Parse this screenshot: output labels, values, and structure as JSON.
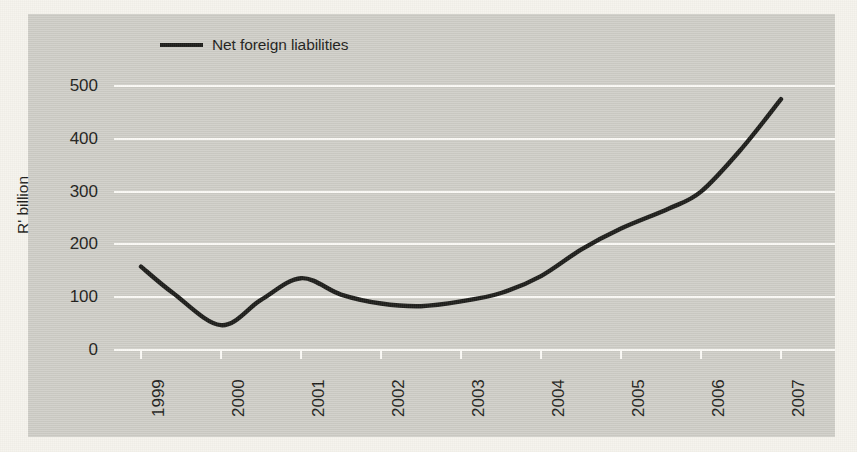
{
  "figure": {
    "background_color": "#f5f3ec",
    "panel_color": "#cfcec7",
    "gridline_color": "#fbfaf6",
    "series_color": "#1b1b18"
  },
  "legend": {
    "position": "top-left-inside",
    "entries": [
      {
        "label": "Net foreign liabilities",
        "color": "#1b1b18",
        "marker": "line-swatch"
      }
    ]
  },
  "axes": {
    "y": {
      "label": "R' billion",
      "ticks": [
        "0",
        "100",
        "200",
        "300",
        "400",
        "500"
      ]
    },
    "x": {
      "label": "",
      "ticks": [
        "1999",
        "2000",
        "2001",
        "2002",
        "2003",
        "2004",
        "2005",
        "2006",
        "2007"
      ]
    }
  },
  "chart_data": {
    "type": "line",
    "title": "",
    "xlabel": "",
    "ylabel": "R' billion",
    "ylim": [
      0,
      520
    ],
    "xlim": [
      1999,
      2007
    ],
    "grid": true,
    "legend_position": "top-left",
    "x": [
      1999,
      2007
    ],
    "categories": [
      "1999",
      "2000",
      "2001",
      "2002",
      "2003",
      "2004",
      "2005",
      "2006",
      "2007"
    ],
    "series": [
      {
        "name": "Net foreign liabilities",
        "color": "#1b1b18",
        "values": [
          158,
          47,
          136,
          88,
          92,
          140,
          230,
          268,
          475
        ],
        "points": [
          {
            "x": 1999.0,
            "y": 158
          },
          {
            "x": 1999.4,
            "y": 108
          },
          {
            "x": 2000.0,
            "y": 47
          },
          {
            "x": 2000.5,
            "y": 95
          },
          {
            "x": 2001.0,
            "y": 136
          },
          {
            "x": 2001.5,
            "y": 105
          },
          {
            "x": 2002.0,
            "y": 88
          },
          {
            "x": 2002.5,
            "y": 83
          },
          {
            "x": 2003.0,
            "y": 92
          },
          {
            "x": 2003.5,
            "y": 108
          },
          {
            "x": 2004.0,
            "y": 140
          },
          {
            "x": 2004.5,
            "y": 190
          },
          {
            "x": 2005.0,
            "y": 230
          },
          {
            "x": 2005.6,
            "y": 268
          },
          {
            "x": 2006.0,
            "y": 300
          },
          {
            "x": 2006.5,
            "y": 380
          },
          {
            "x": 2007.0,
            "y": 475
          }
        ]
      }
    ]
  }
}
